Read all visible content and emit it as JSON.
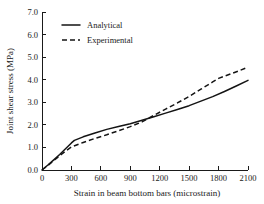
{
  "chart_data": {
    "type": "line",
    "title": "",
    "xlabel": "Strain in beam bottom bars (microstrain)",
    "ylabel": "Joint shear stress (MPa)",
    "xlim": [
      0,
      2100
    ],
    "ylim": [
      0,
      7.0
    ],
    "xticks": [
      0,
      300,
      600,
      900,
      1200,
      1500,
      1800,
      2100
    ],
    "xtick_labels": [
      "0",
      "300",
      "600",
      "900",
      "1200",
      "1500",
      "1800",
      "2100"
    ],
    "yticks": [
      0.0,
      1.0,
      2.0,
      3.0,
      4.0,
      5.0,
      6.0,
      7.0
    ],
    "ytick_labels": [
      "0.0",
      "1.0",
      "2.0",
      "3.0",
      "4.0",
      "5.0",
      "6.0",
      "7.0"
    ],
    "grid": false,
    "legend_position": "upper-left",
    "series": [
      {
        "name": "Analytical",
        "style": "solid",
        "color": "#141414",
        "x": [
          0,
          60,
          120,
          180,
          240,
          300,
          330,
          420,
          540,
          660,
          780,
          900,
          1020,
          1140,
          1260,
          1380,
          1500,
          1620,
          1740,
          1860,
          1980,
          2100
        ],
        "y": [
          0.0,
          0.22,
          0.45,
          0.69,
          0.94,
          1.2,
          1.31,
          1.47,
          1.64,
          1.8,
          1.93,
          2.05,
          2.2,
          2.36,
          2.52,
          2.68,
          2.85,
          3.05,
          3.25,
          3.48,
          3.72,
          3.97
        ]
      },
      {
        "name": "Experimental",
        "style": "dashed",
        "color": "#141414",
        "x": [
          0,
          60,
          120,
          180,
          240,
          300,
          420,
          540,
          660,
          780,
          900,
          1020,
          1140,
          1260,
          1380,
          1500,
          1620,
          1740,
          1800,
          1920,
          2010,
          2100
        ],
        "y": [
          0.0,
          0.2,
          0.42,
          0.63,
          0.84,
          1.02,
          1.22,
          1.4,
          1.56,
          1.74,
          1.92,
          2.13,
          2.42,
          2.7,
          2.97,
          3.26,
          3.58,
          3.9,
          4.06,
          4.25,
          4.4,
          4.56
        ]
      }
    ],
    "legend_entries": [
      "Analytical",
      "Experimental"
    ]
  },
  "colors": {
    "background": "#ffffff",
    "axis": "#1a1a1a",
    "line": "#141414"
  }
}
